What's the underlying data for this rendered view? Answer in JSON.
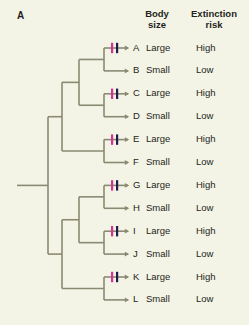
{
  "panel": {
    "label": "A"
  },
  "headers": {
    "body_size": "Body\nsize",
    "body_size_line1": "Body",
    "body_size_line2": "size",
    "extinction_risk_line1": "Extinction",
    "extinction_risk_line2": "risk"
  },
  "colors": {
    "background": "#f4f4e6",
    "branch": "#8a8a73",
    "text": "#231f20",
    "tick_magenta": "#d8338c",
    "tick_navy": "#1d1c4d"
  },
  "chart_data": {
    "type": "tree",
    "title": "A",
    "columns": [
      "",
      "Body size",
      "Extinction risk"
    ],
    "tips": [
      {
        "name": "A",
        "body_size": "Large",
        "extinction_risk": "High",
        "has_ticks": true
      },
      {
        "name": "B",
        "body_size": "Small",
        "extinction_risk": "Low",
        "has_ticks": false
      },
      {
        "name": "C",
        "body_size": "Large",
        "extinction_risk": "High",
        "has_ticks": true
      },
      {
        "name": "D",
        "body_size": "Small",
        "extinction_risk": "Low",
        "has_ticks": false
      },
      {
        "name": "E",
        "body_size": "Large",
        "extinction_risk": "High",
        "has_ticks": true
      },
      {
        "name": "F",
        "body_size": "Small",
        "extinction_risk": "Low",
        "has_ticks": false
      },
      {
        "name": "G",
        "body_size": "Large",
        "extinction_risk": "High",
        "has_ticks": true
      },
      {
        "name": "H",
        "body_size": "Small",
        "extinction_risk": "Low",
        "has_ticks": false
      },
      {
        "name": "I",
        "body_size": "Large",
        "extinction_risk": "High",
        "has_ticks": true
      },
      {
        "name": "J",
        "body_size": "Small",
        "extinction_risk": "Low",
        "has_ticks": false
      },
      {
        "name": "K",
        "body_size": "Large",
        "extinction_risk": "High",
        "has_ticks": true
      },
      {
        "name": "L",
        "body_size": "Small",
        "extinction_risk": "Low",
        "has_ticks": false
      }
    ],
    "topology": "((((A,B),(C,D)),(E,F)),((G,H),(I,J)),(K,L)) - balanced 12-tip cladogram with six terminal sister pairs",
    "tick_marks": {
      "count_per_marked_branch": 2,
      "colors": [
        "#d8338c",
        "#1d1c4d"
      ],
      "on_tips": [
        "A",
        "C",
        "E",
        "G",
        "I",
        "K"
      ]
    }
  }
}
